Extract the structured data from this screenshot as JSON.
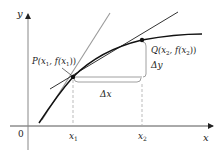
{
  "diagram": {
    "axes": {
      "x_label": "x",
      "y_label": "y",
      "origin_label": "0",
      "x_ticks": [
        {
          "label": "x",
          "sub": "1"
        },
        {
          "label": "x",
          "sub": "2"
        }
      ]
    },
    "points": {
      "P": {
        "label": "P(x",
        "sub": "1",
        "mid": ", f(x",
        "sub2": "1",
        "end": "))"
      },
      "Q": {
        "label": "Q(x",
        "sub": "2",
        "mid": ", f(x",
        "sub2": "2",
        "end": "))"
      }
    },
    "increments": {
      "dx": "Δx",
      "dy": "Δy"
    },
    "colors": {
      "curve": "#1a1a1a",
      "secant": "#333333",
      "tangent": "#9a9a9a",
      "axes": "#555555",
      "dashed": "#aaaaaa",
      "bracket": "#888888"
    }
  }
}
